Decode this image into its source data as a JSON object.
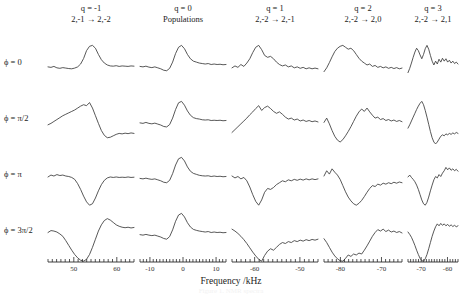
{
  "figure": {
    "axis_title": "Frequency /kHz",
    "caption": "Figure 1. NMR spectra"
  },
  "columns": [
    {
      "q_label": "q = -1",
      "transition": "2,-1 → 2,-2",
      "x_ticks": [
        50,
        60
      ],
      "x_min": 44,
      "x_max": 64,
      "tick_step": 1
    },
    {
      "q_label": "q = 0",
      "transition": "Populations",
      "x_ticks": [
        -10,
        0,
        10
      ],
      "x_min": -13,
      "x_max": 13,
      "tick_step": 1
    },
    {
      "q_label": "q = 1",
      "transition": "2,-2 → 2,-1",
      "x_ticks": [
        -60,
        -50
      ],
      "x_min": -65,
      "x_max": -46,
      "tick_step": 1
    },
    {
      "q_label": "q = 2",
      "transition": "2,-2 → 2,0",
      "x_ticks": [
        -80,
        -70
      ],
      "x_min": -84,
      "x_max": -65,
      "tick_step": 1
    },
    {
      "q_label": "q = 3",
      "transition": "2,-2 → 2,1",
      "x_ticks": [
        -70,
        -60
      ],
      "x_min": -75,
      "x_max": -56,
      "tick_step": 1
    }
  ],
  "rows": [
    {
      "phase_label": "ϕ = 0"
    },
    {
      "phase_label": "ϕ = π/2"
    },
    {
      "phase_label": "ϕ = π"
    },
    {
      "phase_label": "ϕ = 3π/2"
    }
  ],
  "chart_data": {
    "type": "line",
    "title": "",
    "xlabel": "Frequency /kHz",
    "ylabel": "",
    "grid": false,
    "legend": "none",
    "panels": [
      {
        "col": 0,
        "row": 0,
        "q": "q = -1",
        "phase": "ϕ = 0",
        "lineshape": "absorption-positive",
        "y": [
          0.1,
          0.08,
          0.12,
          0.06,
          0.04,
          0.07,
          0.05,
          0.03,
          0.02,
          0.05,
          0.1,
          0.22,
          0.45,
          0.78,
          0.96,
          1.0,
          0.88,
          0.62,
          0.4,
          0.26,
          0.18,
          0.14,
          0.13,
          0.15,
          0.12,
          0.14,
          0.13,
          0.12,
          0.14,
          0.13
        ]
      },
      {
        "col": 0,
        "row": 1,
        "q": "q = -1",
        "phase": "ϕ = π/2",
        "lineshape": "dispersion-positive-first",
        "y": [
          0.02,
          0.08,
          0.16,
          0.24,
          0.32,
          0.4,
          0.46,
          0.52,
          0.58,
          0.64,
          0.72,
          0.8,
          0.86,
          0.82,
          0.95,
          0.72,
          0.4,
          0.08,
          -0.22,
          -0.42,
          -0.52,
          -0.5,
          -0.44,
          -0.38,
          -0.34,
          -0.36,
          -0.33,
          -0.35,
          -0.32,
          -0.34
        ]
      },
      {
        "col": 0,
        "row": 2,
        "q": "q = -1",
        "phase": "ϕ = π",
        "lineshape": "absorption-negative",
        "y": [
          0.18,
          0.26,
          0.22,
          0.28,
          0.24,
          0.26,
          0.22,
          0.2,
          0.16,
          0.08,
          -0.1,
          -0.34,
          -0.62,
          -0.86,
          -1.0,
          -0.94,
          -0.7,
          -0.4,
          -0.14,
          0.04,
          0.14,
          0.18,
          0.16,
          0.18,
          0.16,
          0.17,
          0.16,
          0.18,
          0.16,
          0.17
        ]
      },
      {
        "col": 0,
        "row": 3,
        "q": "q = -1",
        "phase": "ϕ = 3π/2",
        "lineshape": "dispersion-negative-first",
        "y": [
          0.2,
          0.28,
          0.26,
          0.22,
          0.14,
          0.04,
          -0.14,
          -0.34,
          -0.54,
          -0.72,
          -0.86,
          -0.96,
          -1.0,
          -0.92,
          -0.72,
          -0.42,
          -0.08,
          0.26,
          0.52,
          0.7,
          0.78,
          0.72,
          0.62,
          0.52,
          0.46,
          0.42,
          0.4,
          0.42,
          0.39,
          0.41
        ]
      },
      {
        "col": 1,
        "row": 0,
        "q": "q = 0",
        "phase": "ϕ = 0",
        "lineshape": "absorption-positive",
        "y": [
          0.12,
          0.1,
          0.13,
          0.09,
          0.07,
          0.1,
          0.06,
          0.02,
          -0.04,
          -0.06,
          0.04,
          0.3,
          0.66,
          0.92,
          1.0,
          0.86,
          0.62,
          0.44,
          0.34,
          0.3,
          0.26,
          0.24,
          0.22,
          0.24,
          0.2,
          0.22,
          0.2,
          0.21,
          0.19,
          0.2
        ]
      },
      {
        "col": 1,
        "row": 1,
        "q": "q = 0",
        "phase": "ϕ = π/2",
        "lineshape": "absorption-positive",
        "y": [
          0.1,
          0.08,
          0.12,
          0.08,
          0.06,
          0.09,
          0.05,
          0.01,
          -0.05,
          -0.07,
          0.03,
          0.3,
          0.66,
          0.94,
          1.0,
          0.84,
          0.6,
          0.42,
          0.32,
          0.28,
          0.26,
          0.23,
          0.22,
          0.23,
          0.2,
          0.21,
          0.2,
          0.21,
          0.19,
          0.2
        ]
      },
      {
        "col": 1,
        "row": 2,
        "q": "q = 0",
        "phase": "ϕ = π",
        "lineshape": "absorption-positive",
        "y": [
          0.12,
          0.1,
          0.13,
          0.1,
          0.08,
          0.1,
          0.06,
          0.02,
          -0.04,
          -0.06,
          0.04,
          0.32,
          0.68,
          0.94,
          1.0,
          0.85,
          0.6,
          0.42,
          0.33,
          0.29,
          0.25,
          0.23,
          0.22,
          0.23,
          0.2,
          0.22,
          0.2,
          0.21,
          0.19,
          0.2
        ]
      },
      {
        "col": 1,
        "row": 3,
        "q": "q = 0",
        "phase": "ϕ = 3π/2",
        "lineshape": "absorption-positive",
        "y": [
          0.11,
          0.09,
          0.12,
          0.09,
          0.07,
          0.09,
          0.05,
          0.01,
          -0.05,
          -0.08,
          0.03,
          0.31,
          0.67,
          0.93,
          1.0,
          0.85,
          0.61,
          0.43,
          0.33,
          0.29,
          0.26,
          0.24,
          0.22,
          0.24,
          0.2,
          0.22,
          0.2,
          0.21,
          0.19,
          0.2
        ]
      },
      {
        "col": 2,
        "row": 0,
        "q": "q = 1",
        "phase": "ϕ = 0",
        "lineshape": "absorption-positive-noisy",
        "y": [
          0.06,
          0.14,
          0.08,
          0.2,
          0.12,
          0.26,
          0.44,
          0.7,
          0.92,
          1.0,
          0.82,
          0.58,
          0.5,
          0.54,
          0.44,
          0.3,
          0.2,
          0.14,
          0.18,
          0.1,
          0.14,
          0.06,
          0.1,
          0.04,
          0.08,
          0.02,
          0.06,
          0.02,
          0.05,
          0.02
        ]
      },
      {
        "col": 2,
        "row": 1,
        "q": "q = 1",
        "phase": "ϕ = π/2",
        "lineshape": "dispersion-noisy",
        "y": [
          -0.3,
          -0.18,
          -0.06,
          0.06,
          0.18,
          0.3,
          0.44,
          0.56,
          0.7,
          0.82,
          0.62,
          0.74,
          0.8,
          0.7,
          0.58,
          0.5,
          0.56,
          0.46,
          0.34,
          0.26,
          0.3,
          0.22,
          0.26,
          0.18,
          0.22,
          0.16,
          0.2,
          0.15,
          0.18,
          0.14
        ]
      },
      {
        "col": 2,
        "row": 2,
        "q": "q = 1",
        "phase": "ϕ = π",
        "lineshape": "absorption-negative-noisy",
        "y": [
          0.22,
          0.14,
          0.2,
          0.1,
          0.16,
          0.02,
          -0.24,
          -0.56,
          -0.84,
          -1.0,
          -0.78,
          -0.46,
          -0.3,
          -0.34,
          -0.26,
          -0.14,
          -0.06,
          0.02,
          -0.02,
          0.06,
          0.02,
          0.08,
          0.04,
          0.09,
          0.05,
          0.1,
          0.06,
          0.1,
          0.07,
          0.1
        ]
      },
      {
        "col": 2,
        "row": 3,
        "q": "q = 1",
        "phase": "ϕ = 3π/2",
        "lineshape": "dispersion-negative-noisy",
        "y": [
          0.34,
          0.26,
          0.16,
          0.04,
          -0.1,
          -0.26,
          -0.44,
          -0.62,
          -0.78,
          -0.92,
          -1.0,
          -0.76,
          -0.58,
          -0.48,
          -0.54,
          -0.42,
          -0.3,
          -0.22,
          -0.26,
          -0.18,
          -0.22,
          -0.14,
          -0.18,
          -0.12,
          -0.16,
          -0.1,
          -0.14,
          -0.09,
          -0.12,
          -0.08
        ]
      },
      {
        "col": 3,
        "row": 0,
        "q": "q = 2",
        "phase": "ϕ = 0",
        "lineshape": "broad-positive-noisy",
        "y": [
          -0.1,
          0.06,
          0.28,
          0.52,
          0.74,
          0.88,
          0.96,
          1.0,
          0.92,
          0.84,
          0.88,
          0.78,
          0.62,
          0.46,
          0.34,
          0.26,
          0.18,
          0.22,
          0.12,
          0.16,
          0.08,
          0.12,
          0.06,
          0.1,
          0.04,
          0.08,
          0.03,
          0.07,
          0.02,
          0.05
        ]
      },
      {
        "col": 3,
        "row": 1,
        "q": "q = 2",
        "phase": "ϕ = π/2",
        "lineshape": "mixed-noisy",
        "y": [
          0.12,
          0.3,
          0.06,
          -0.22,
          -0.46,
          -0.62,
          -0.7,
          -0.6,
          -0.44,
          -0.26,
          -0.06,
          0.16,
          0.38,
          0.56,
          0.68,
          0.58,
          0.72,
          0.56,
          0.42,
          0.3,
          0.34,
          0.24,
          0.28,
          0.2,
          0.24,
          0.18,
          0.22,
          0.16,
          0.2,
          0.15
        ]
      },
      {
        "col": 3,
        "row": 2,
        "q": "q = 2",
        "phase": "ϕ = π",
        "lineshape": "broad-negative-noisy",
        "y": [
          0.22,
          0.44,
          0.3,
          0.52,
          0.38,
          0.26,
          0.08,
          -0.18,
          -0.44,
          -0.66,
          -0.82,
          -0.94,
          -1.0,
          -0.92,
          -0.8,
          -0.64,
          -0.46,
          -0.3,
          -0.18,
          -0.22,
          -0.12,
          -0.16,
          -0.08,
          -0.12,
          -0.06,
          -0.1,
          -0.04,
          -0.08,
          -0.03,
          -0.06
        ]
      },
      {
        "col": 3,
        "row": 3,
        "q": "q = 2",
        "phase": "ϕ = 3π/2",
        "lineshape": "broad-negative-dip",
        "y": [
          -0.06,
          -0.22,
          -0.42,
          -0.62,
          -0.78,
          -0.9,
          -0.98,
          -1.0,
          -0.88,
          -0.74,
          -0.8,
          -0.7,
          -0.74,
          -0.66,
          -0.7,
          -0.54,
          -0.36,
          -0.16,
          0.04,
          0.2,
          0.32,
          0.26,
          0.34,
          0.24,
          0.3,
          0.22,
          0.26,
          0.2,
          0.24,
          0.18
        ]
      },
      {
        "col": 4,
        "row": 0,
        "q": "q = 3",
        "phase": "ϕ = 0",
        "lineshape": "noisy-positive",
        "y": [
          -0.14,
          0.04,
          0.26,
          0.5,
          0.72,
          0.88,
          0.78,
          0.6,
          0.44,
          0.62,
          0.86,
          1.0,
          0.84,
          0.58,
          0.34,
          0.18,
          0.34,
          0.22,
          0.42,
          0.3,
          0.46,
          0.34,
          0.44,
          0.3,
          0.38,
          0.26,
          0.34,
          0.24,
          0.3,
          0.22
        ]
      },
      {
        "col": 4,
        "row": 1,
        "q": "q = 3",
        "phase": "ϕ = π/2",
        "lineshape": "dispersion-noisy",
        "y": [
          -0.12,
          0.02,
          0.18,
          0.34,
          0.5,
          0.66,
          0.8,
          0.92,
          1.0,
          0.86,
          0.62,
          0.34,
          0.04,
          -0.26,
          -0.52,
          -0.7,
          -0.78,
          -0.7,
          -0.58,
          -0.46,
          -0.4,
          -0.44,
          -0.36,
          -0.4,
          -0.34,
          -0.38,
          -0.32,
          -0.36,
          -0.3,
          -0.34
        ]
      },
      {
        "col": 4,
        "row": 2,
        "q": "q = 3",
        "phase": "ϕ = π",
        "lineshape": "absorption-negative-noisy",
        "y": [
          0.18,
          0.26,
          0.16,
          0.08,
          -0.02,
          -0.16,
          -0.34,
          -0.56,
          -0.78,
          -0.94,
          -1.0,
          -0.88,
          -0.66,
          -0.4,
          -0.16,
          0.06,
          0.2,
          0.14,
          0.28,
          0.2,
          0.34,
          0.44,
          0.58,
          0.48,
          0.56,
          0.46,
          0.52,
          0.44,
          0.5,
          0.42
        ]
      },
      {
        "col": 4,
        "row": 3,
        "q": "q = 3",
        "phase": "ϕ = 3π/2",
        "lineshape": "dispersion-negative-noisy",
        "y": [
          0.22,
          0.12,
          0.0,
          -0.16,
          -0.34,
          -0.54,
          -0.72,
          -0.88,
          -0.98,
          -1.0,
          -0.9,
          -0.72,
          -0.48,
          -0.22,
          0.04,
          0.26,
          0.44,
          0.56,
          0.48,
          0.58,
          0.5,
          0.56,
          0.48,
          0.54,
          0.46,
          0.52,
          0.45,
          0.5,
          0.44,
          0.48
        ]
      }
    ]
  }
}
